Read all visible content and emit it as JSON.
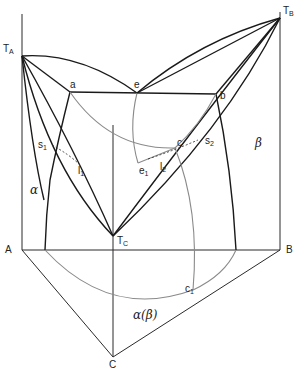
{
  "diagram": {
    "type": "ternary-phase-diagram-perspective",
    "labels": {
      "TA": {
        "main": "T",
        "sub": "A"
      },
      "TB": {
        "main": "T",
        "sub": "B"
      },
      "TC": {
        "main": "T",
        "sub": "C"
      },
      "a": "a",
      "e": "e",
      "b": "b",
      "c": "c",
      "s1": {
        "main": "s",
        "sub": "1"
      },
      "l1": {
        "main": "l",
        "sub": "1"
      },
      "e1": {
        "main": "e",
        "sub": "1"
      },
      "l2": {
        "main": "l",
        "sub": "2"
      },
      "s2": {
        "main": "s",
        "sub": "2"
      },
      "c1": {
        "main": "c",
        "sub": "1"
      },
      "alpha": "α",
      "beta": "β",
      "alpha_beta": "α(β)",
      "A": "A",
      "B": "B",
      "C": "C"
    },
    "colors": {
      "line": "#1a1a1a",
      "projection": "#8a8a8a",
      "background": "#ffffff"
    }
  }
}
